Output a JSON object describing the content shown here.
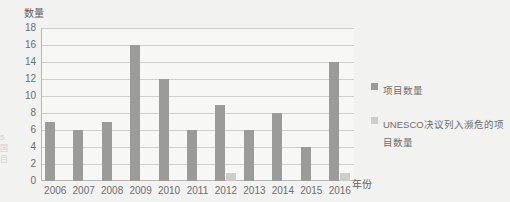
{
  "bleed_text": "5\n国\n目",
  "legend": {
    "position": "right",
    "items": [
      {
        "label": "项目数量",
        "color": "#9b9b9a",
        "swatch_name": "legend-swatch-series1"
      },
      {
        "label": "UNESCO决议列入濒危的项目数量",
        "color": "#cdcdcc",
        "swatch_name": "legend-swatch-series2"
      }
    ]
  },
  "chart_data": {
    "type": "bar",
    "title": "",
    "subtitle": "",
    "xlabel": "年份",
    "ylabel": "数量",
    "ylim": [
      0,
      18
    ],
    "ytick_step": 2,
    "yticks": [
      "18",
      "16",
      "14",
      "12",
      "10",
      "8",
      "6",
      "4",
      "2",
      "0"
    ],
    "grid": "horizontal",
    "legend_position": "right",
    "categories": [
      "2006",
      "2007",
      "2008",
      "2009",
      "2010",
      "2011",
      "2012",
      "2013",
      "2014",
      "2015",
      "2016"
    ],
    "series": [
      {
        "name": "项目数量",
        "color": "#9b9b9a",
        "values": [
          7,
          6,
          7,
          16,
          12,
          6,
          9,
          6,
          8,
          4,
          14
        ]
      },
      {
        "name": "UNESCO决议列入濒危的项目数量",
        "color": "#cdcdcc",
        "values": [
          0,
          0,
          0,
          0,
          0,
          0,
          1,
          0,
          0,
          0,
          1
        ]
      }
    ]
  }
}
